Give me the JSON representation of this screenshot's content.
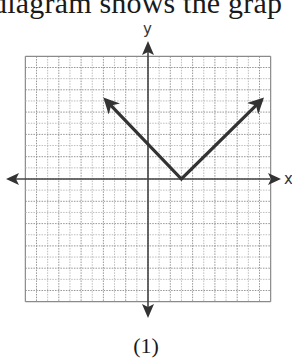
{
  "header": {
    "text": "diagram shows the grap"
  },
  "caption": {
    "label": "(1)"
  },
  "axes": {
    "x_label": "x",
    "y_label": "y"
  },
  "colors": {
    "grid_major": "#8a8a8a",
    "grid_minor": "#b5b5b5",
    "axis": "#444444",
    "graph_line": "#333333",
    "text": "#1a1a1a"
  },
  "chart_data": {
    "type": "line",
    "title": "",
    "subtitle": "",
    "xlabel": "x",
    "ylabel": "y",
    "xlim": [
      -11,
      11
    ],
    "ylim": [
      -11,
      11
    ],
    "grid": true,
    "legend": null,
    "tick_labels": "none shown",
    "function": "approximately y = |x - 3| (inferred from estimated slopes of about -1 and +1; not confirmed at exact lattice points)",
    "series": [
      {
        "name": "absolute value graph",
        "points": [
          {
            "x": -3.8,
            "y": 7.1,
            "note": "left arrowhead (approx.)"
          },
          {
            "x": 3,
            "y": 0,
            "note": "vertex (approx.)"
          },
          {
            "x": 10.2,
            "y": 7.1,
            "note": "right arrowhead (approx.)"
          }
        ],
        "arrows": [
          "left end",
          "right end"
        ]
      }
    ],
    "annotations": [
      "(1)"
    ]
  }
}
